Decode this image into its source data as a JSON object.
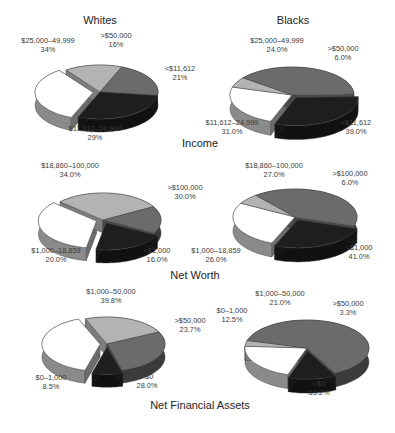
{
  "column_titles": {
    "left": "Whites",
    "right": "Blacks"
  },
  "row_titles": [
    "Income",
    "Net Worth",
    "Net Financial Assets"
  ],
  "colors": {
    "white": "#ffffff",
    "light": "#b3b3b3",
    "medium": "#6b6b6b",
    "dark": "#1e1e1e"
  },
  "chart_data": [
    {
      "type": "pie",
      "title": "Income — Whites",
      "slices": [
        {
          "label": "$25,000–49,999",
          "value": 34,
          "display": "34%",
          "color": "white"
        },
        {
          "label": ">$50,000",
          "value": 16,
          "display": "16%",
          "color": "light"
        },
        {
          "label": "<$11,612",
          "value": 21,
          "display": "21%",
          "color": "medium"
        },
        {
          "label": "$11,612–24,999",
          "value": 29,
          "display": "29%",
          "color": "dark"
        }
      ]
    },
    {
      "type": "pie",
      "title": "Income — Blacks",
      "slices": [
        {
          "label": "$25,000–49,999",
          "value": 24.0,
          "display": "24.0%",
          "color": "white"
        },
        {
          "label": ">$50,000",
          "value": 6.0,
          "display": "6.0%",
          "color": "light"
        },
        {
          "label": "<$11,612",
          "value": 39.0,
          "display": "39.0%",
          "color": "medium"
        },
        {
          "label": "$11,612–24,999",
          "value": 31.0,
          "display": "31.0%",
          "color": "dark"
        }
      ]
    },
    {
      "type": "pie",
      "title": "Net Worth — Whites",
      "slices": [
        {
          "label": "$18,860–100,000",
          "value": 34.0,
          "display": "34.0%",
          "color": "white"
        },
        {
          "label": ">$100,000",
          "value": 30.0,
          "display": "30.0%",
          "color": "light"
        },
        {
          "label": "<$1,000",
          "value": 16.0,
          "display": "16.0%",
          "color": "medium"
        },
        {
          "label": "$1,000–18,859",
          "value": 20.0,
          "display": "20.0%",
          "color": "dark"
        }
      ]
    },
    {
      "type": "pie",
      "title": "Net Worth — Blacks",
      "slices": [
        {
          "label": "$18,860–100,000",
          "value": 27.0,
          "display": "27.0%",
          "color": "white"
        },
        {
          "label": ">$100,000",
          "value": 6.0,
          "display": "6.0%",
          "color": "light"
        },
        {
          "label": "<$1,000",
          "value": 41.0,
          "display": "41.0%",
          "color": "medium"
        },
        {
          "label": "$1,000–18,859",
          "value": 26.0,
          "display": "26.0%",
          "color": "dark"
        }
      ]
    },
    {
      "type": "pie",
      "title": "Net Financial Assets — Whites",
      "slices": [
        {
          "label": "$1,000–50,000",
          "value": 39.8,
          "display": "39.8%",
          "color": "white"
        },
        {
          "label": ">$50,000",
          "value": 23.7,
          "display": "23.7%",
          "color": "light"
        },
        {
          "label": "<$0",
          "value": 28.0,
          "display": "28.0%",
          "color": "medium"
        },
        {
          "label": "$0–1,000",
          "value": 8.5,
          "display": "8.5%",
          "color": "dark"
        }
      ]
    },
    {
      "type": "pie",
      "title": "Net Financial Assets — Blacks",
      "slices": [
        {
          "label": "$1,000–50,000",
          "value": 21.0,
          "display": "21.0%",
          "color": "white"
        },
        {
          "label": ">$50,000",
          "value": 3.3,
          "display": "3.3%",
          "color": "light"
        },
        {
          "label": "<$0",
          "value": 63.2,
          "display": "63.2%",
          "color": "medium"
        },
        {
          "label": "$0–1,000",
          "value": 12.5,
          "display": "12.5%",
          "color": "dark"
        }
      ]
    }
  ],
  "layout": {
    "pies": [
      {
        "cx": 100,
        "cy": 92,
        "rx": 58,
        "ry": 27,
        "depth": 13,
        "start": 112,
        "explode": [
          1,
          0,
          0,
          0
        ],
        "labels": [
          {
            "x": 48,
            "y": 45
          },
          {
            "x": 116,
            "y": 40
          },
          {
            "x": 180,
            "y": 73
          },
          {
            "x": 95,
            "y": 133
          }
        ]
      },
      {
        "cx": 292,
        "cy": 95,
        "rx": 62,
        "ry": 28,
        "depth": 14,
        "start": 110,
        "explode": [
          0,
          0,
          0,
          1
        ],
        "labels": [
          {
            "x": 277,
            "y": 45
          },
          {
            "x": 343,
            "y": 53
          },
          {
            "x": 356,
            "y": 127
          },
          {
            "x": 232,
            "y": 127
          }
        ]
      },
      {
        "cx": 103,
        "cy": 220,
        "rx": 58,
        "ry": 27,
        "depth": 13,
        "start": 100,
        "explode": [
          1,
          0,
          0,
          1
        ],
        "labels": [
          {
            "x": 70,
            "y": 170
          },
          {
            "x": 185,
            "y": 192
          },
          {
            "x": 157,
            "y": 255
          },
          {
            "x": 56,
            "y": 255
          }
        ]
      },
      {
        "cx": 295,
        "cy": 217,
        "rx": 62,
        "ry": 28,
        "depth": 14,
        "start": 112,
        "explode": [
          0,
          0,
          0,
          1
        ],
        "labels": [
          {
            "x": 274,
            "y": 170
          },
          {
            "x": 350,
            "y": 178
          },
          {
            "x": 359,
            "y": 252
          },
          {
            "x": 216,
            "y": 255
          }
        ]
      },
      {
        "cx": 107,
        "cy": 344,
        "rx": 58,
        "ry": 27,
        "depth": 13,
        "start": 105,
        "explode": [
          1,
          0,
          0,
          1
        ],
        "labels": [
          {
            "x": 111,
            "y": 296
          },
          {
            "x": 190,
            "y": 325
          },
          {
            "x": 147,
            "y": 381
          },
          {
            "x": 51,
            "y": 382
          }
        ]
      },
      {
        "cx": 307,
        "cy": 348,
        "rx": 62,
        "ry": 28,
        "depth": 14,
        "start": 108,
        "explode": [
          0,
          0,
          0,
          1
        ],
        "labels": [
          {
            "x": 280,
            "y": 298
          },
          {
            "x": 348,
            "y": 308
          },
          {
            "x": 319,
            "y": 388
          },
          {
            "x": 232,
            "y": 315
          }
        ]
      }
    ],
    "title_positions": {
      "left": {
        "x": 100,
        "y": 20
      },
      "right": {
        "x": 293,
        "y": 20
      },
      "rows": [
        {
          "x": 200,
          "y": 143
        },
        {
          "x": 195,
          "y": 275
        },
        {
          "x": 200,
          "y": 405
        }
      ]
    }
  }
}
